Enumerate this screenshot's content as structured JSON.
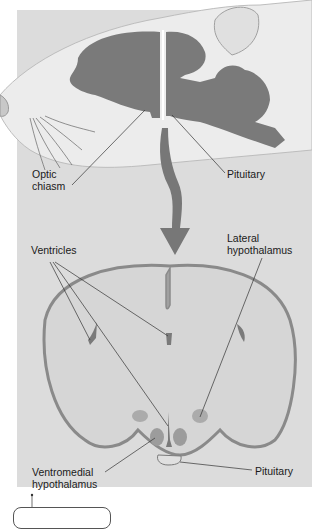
{
  "diagram": {
    "type": "anatomical-illustration",
    "colors": {
      "panel_background": "#dcdcdc",
      "brain_fill": "#7a7a7a",
      "section_fill": "#d6d6d6",
      "section_outline": "#8a8a8a",
      "nuclei": "#a8a8a8",
      "arrow": "#777777"
    },
    "labels": {
      "optic_chiasm": [
        "Optic",
        "chiasm"
      ],
      "pituitary_top": "Pituitary",
      "ventricles": "Ventricles",
      "lateral_hypothalamus": [
        "Lateral",
        "hypothalamus"
      ],
      "ventromedial_hypothalamus": [
        "Ventromedial",
        "hypothalamus"
      ],
      "pituitary_bottom": "Pituitary"
    }
  }
}
